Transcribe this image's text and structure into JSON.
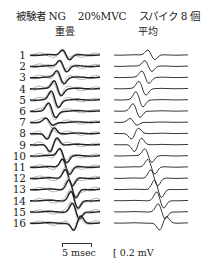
{
  "chart_data": {
    "type": "line",
    "title": "被験者 NG  20%MVC  スパイク 8 個",
    "title_parts": [
      "被験者 NG",
      "20%MVC",
      "スパイク 8 個"
    ],
    "panels": [
      {
        "name": "重畳",
        "description": "superimposed spike-triggered traces (8 spikes overlaid, dark + light gray sweeps)"
      },
      {
        "name": "平均",
        "description": "averaged waveform per channel"
      }
    ],
    "rows": [
      "1",
      "2",
      "3",
      "4",
      "5",
      "6",
      "7",
      "8",
      "9",
      "10",
      "11",
      "12",
      "13",
      "14",
      "15",
      "16"
    ],
    "peak_x_fraction": [
      0.46,
      0.42,
      0.38,
      0.34,
      0.3,
      0.26,
      0.22,
      0.24,
      0.28,
      0.42,
      0.46,
      0.5,
      0.55,
      0.58,
      0.6,
      0.62
    ],
    "peak_amplitude": [
      1.4,
      1.6,
      1.8,
      2.0,
      2.2,
      2.0,
      1.0,
      -1.6,
      -2.0,
      2.0,
      2.2,
      2.4,
      2.6,
      2.4,
      2.2,
      -2.0
    ],
    "scale_bars": {
      "time": "5 msec",
      "voltage": "0.2 mV"
    },
    "xlabel": "",
    "ylabel": ""
  },
  "header": {
    "subject": "被験者 NG",
    "force": "20%MVC",
    "spikes": "スパイク 8 個"
  },
  "columns": {
    "left": "重畳",
    "right": "平均"
  },
  "row_labels": [
    "1",
    "2",
    "3",
    "4",
    "5",
    "6",
    "7",
    "8",
    "9",
    "10",
    "11",
    "12",
    "13",
    "14",
    "15",
    "16"
  ],
  "scale": {
    "time_label": "5 msec",
    "voltage_label": "[ 0.2 mV"
  },
  "colors": {
    "trace_dark": "#222222",
    "trace_light": "#a8a8a8",
    "baseline": "#555555"
  }
}
